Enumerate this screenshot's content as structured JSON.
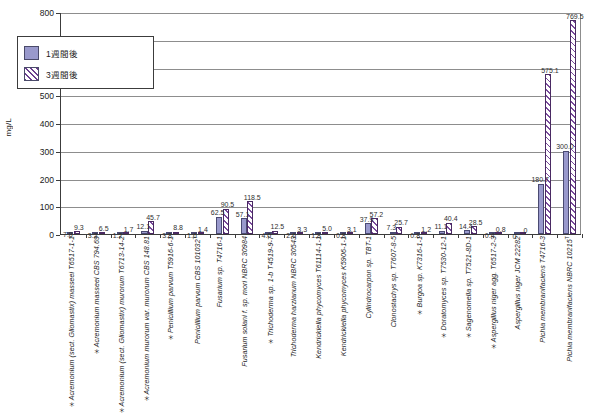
{
  "chart_data": {
    "type": "bar",
    "title": "",
    "xlabel": "",
    "ylabel": "mg/L",
    "ylim": [
      0,
      800
    ],
    "ytick_step": 100,
    "yticks": [
      "0",
      "100",
      "200",
      "300",
      "400",
      "500",
      "600",
      "700",
      "800"
    ],
    "grid": true,
    "legend_position": "upper-left-inside",
    "categories": [
      "Acremonium (sect. Gliomastix) masseei T6517-1-1",
      "Acremonium masseei CBS 794.69",
      "Acremonium (sect. Gliomastix) murorum T6713-14-2",
      "Acremonium murorum var. murorum CBS 148.81",
      "Penicillium parvum T5916-6-1",
      "Penicillium parvum CBS 101032",
      "Fusarium sp. T4716-1",
      "Fusarium solani f. sp. mori NBRC 30984",
      "Trichoderma sp. 1-b T4519-9-7",
      "Trichoderma harzianum NBRC 30543",
      "Kendrickiella phycomyces T61114-1-1",
      "Kendrickiella phycomyces K5906-1-1",
      "Cylindrocarpon sp. TBT-1",
      "Clonostachys sp. T7607-8-5",
      "Burgoa sp. K7316-1-1",
      "Doratomyces sp. T7530-12-1",
      "Sagenomella sp. T7521-8D-1",
      "Aspergillus niger agg. T6517-2-3",
      "Aspergillus niger JCM 22282",
      "Pichia membranifaciens T4716-3",
      "Pichia membranifaciens NBRC 10215"
    ],
    "series": [
      {
        "name": "1週間後",
        "color": "#9999cc",
        "values": [
          7.8,
          3.2,
          1.2,
          12.1,
          3.8,
          1.6,
          62.5,
          57.1,
          4.0,
          2.6,
          1.8,
          0.8,
          37.9,
          7.3,
          0.8,
          11.1,
          14.4,
          0.4,
          0,
          180.7,
          300.0
        ]
      },
      {
        "name": "3週間後",
        "color": "#ffffff",
        "hatch": "diagonal",
        "values": [
          9.3,
          6.5,
          1.7,
          45.7,
          8.8,
          1.4,
          90.5,
          118.5,
          12.5,
          3.3,
          5.0,
          3.1,
          57.2,
          25.7,
          1.2,
          40.4,
          28.5,
          0.8,
          0,
          575.1,
          769.5
        ]
      }
    ],
    "data_labels": {
      "series_1w": [
        "7.8",
        "3.2",
        "1.2",
        "12.1",
        "3.8",
        "1.6",
        "62.5",
        "57.1",
        "4.0",
        "2.6",
        "1.8",
        "0.8",
        "37.9",
        "7.3",
        "0.8",
        "11.1",
        "14.4",
        "0.4",
        "0",
        "180.7",
        "300.0"
      ],
      "series_3w": [
        "9.3",
        "6.5",
        "1.7",
        "45.7",
        "8.8",
        "1.4",
        "90.5",
        "118.5",
        "12.5",
        "3.3",
        "5.0",
        "3.1",
        "57.2",
        "25.7",
        "1.2",
        "40.4",
        "28.5",
        "0.8",
        "0",
        "575.1",
        "769.5"
      ]
    },
    "category_footnote_marks": [
      "*",
      "*",
      "*",
      "*",
      "*",
      "",
      "",
      "",
      "*",
      "",
      "",
      "",
      "",
      "",
      "*",
      "*",
      "*",
      "*",
      "",
      "",
      ""
    ]
  },
  "legend": {
    "items": [
      {
        "label": "1週間後",
        "swatch": "solid-purple"
      },
      {
        "label": "3週間後",
        "swatch": "hatched-diagonal"
      }
    ]
  },
  "axis": {
    "y_title": "mg/L"
  },
  "caption": ""
}
